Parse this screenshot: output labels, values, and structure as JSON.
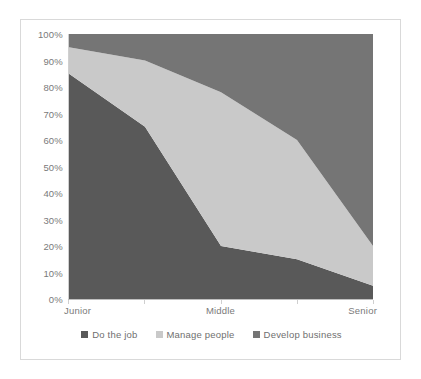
{
  "chart_data": {
    "type": "area",
    "stacked": true,
    "title": "",
    "xlabel": "",
    "ylabel": "",
    "ylim": [
      0,
      100
    ],
    "y_tick_labels": [
      "100%",
      "90%",
      "80%",
      "70%",
      "60%",
      "50%",
      "40%",
      "30%",
      "20%",
      "10%",
      "0%"
    ],
    "y_tick_values": [
      100,
      90,
      80,
      70,
      60,
      50,
      40,
      30,
      20,
      10,
      0
    ],
    "x": [
      0,
      1,
      2,
      3,
      4
    ],
    "categories": [
      "Junior",
      "",
      "Middle",
      "",
      "Senior"
    ],
    "x_tick_labels": [
      "Junior",
      "Middle",
      "Senior"
    ],
    "grid": false,
    "legend_position": "bottom",
    "series": [
      {
        "name": "Do the job",
        "color": "#595959",
        "values": [
          85,
          65,
          20,
          15,
          5
        ]
      },
      {
        "name": "Manage people",
        "color": "#c9c9c9",
        "values": [
          10,
          25,
          58,
          45,
          15
        ]
      },
      {
        "name": "Develop business",
        "color": "#757575",
        "values": [
          5,
          10,
          22,
          40,
          80
        ]
      }
    ]
  },
  "legend": {
    "items": [
      {
        "label": "Do the job",
        "color": "#595959"
      },
      {
        "label": "Manage people",
        "color": "#c9c9c9"
      },
      {
        "label": "Develop business",
        "color": "#757575"
      }
    ]
  },
  "axes": {
    "y_labels": [
      "100%",
      "90%",
      "80%",
      "70%",
      "60%",
      "50%",
      "40%",
      "30%",
      "20%",
      "10%",
      "0%"
    ],
    "x_labels": [
      "Junior",
      "Middle",
      "Senior"
    ]
  },
  "colors": {
    "series_do_the_job": "#595959",
    "series_manage_people": "#c9c9c9",
    "series_develop_business": "#757575",
    "axis_text": "#7a7a7a",
    "card_border": "#d9d9d9",
    "background": "#ffffff"
  }
}
